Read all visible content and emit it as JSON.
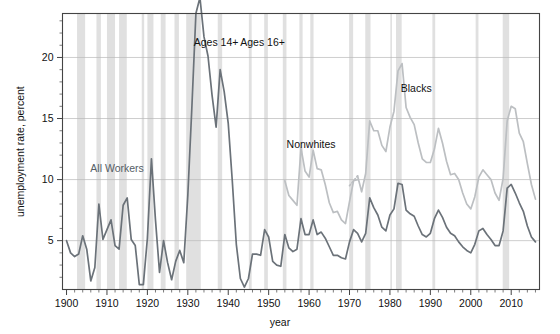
{
  "chart_data": {
    "type": "line",
    "title": "",
    "xlabel": "year",
    "ylabel": "unemployment rate, percent",
    "xlim": [
      1899,
      2017
    ],
    "ylim": [
      1.0,
      23.6
    ],
    "xticks": [
      1900,
      1910,
      1920,
      1930,
      1940,
      1950,
      1960,
      1970,
      1980,
      1990,
      2000,
      2010
    ],
    "xticklabels": [
      "1900",
      "1910",
      "1920",
      "1930",
      "1940",
      "1950",
      "1960",
      "1970",
      "1980",
      "1990",
      "2000",
      "2010"
    ],
    "yticks": [
      5,
      10,
      15,
      20
    ],
    "yticklabels": [
      "5",
      "10",
      "15",
      "20"
    ],
    "minor_x_interval": 2,
    "minor_y_interval": 1,
    "grid": "horizontal-only",
    "legend": "none",
    "annotations": [
      {
        "text": "All Workers",
        "x": 1912.5,
        "y": 10.6,
        "color": "#555e66"
      },
      {
        "text": "Ages 14+",
        "x": 1937.0,
        "y": 20.9,
        "color": "#111111"
      },
      {
        "text": "Ages 16+",
        "x": 1948.5,
        "y": 20.9,
        "color": "#111111"
      },
      {
        "text": "Nonwhites",
        "x": 1960.5,
        "y": 12.6,
        "color": "#111111"
      },
      {
        "text": "Blacks",
        "x": 1986.5,
        "y": 17.2,
        "color": "#111111"
      }
    ],
    "colors": {
      "all_workers": "#6b7279",
      "nonwhites": "#bcbfc2",
      "blacks": "#bcbfc2",
      "recession_band": "#e0e0e0",
      "axis": "#444444",
      "gridline": "#b9b9b9",
      "background": "#ffffff"
    },
    "recessions": [
      [
        1902.6,
        1904.6
      ],
      [
        1907.4,
        1908.5
      ],
      [
        1910.0,
        1912.0
      ],
      [
        1913.0,
        1914.9
      ],
      [
        1918.6,
        1919.2
      ],
      [
        1920.0,
        1921.5
      ],
      [
        1923.3,
        1924.5
      ],
      [
        1926.7,
        1927.8
      ],
      [
        1929.6,
        1933.2
      ],
      [
        1937.4,
        1938.5
      ],
      [
        1945.1,
        1945.8
      ],
      [
        1948.9,
        1949.8
      ],
      [
        1953.5,
        1954.4
      ],
      [
        1957.6,
        1958.4
      ],
      [
        1960.3,
        1961.1
      ],
      [
        1969.9,
        1970.9
      ],
      [
        1973.9,
        1975.2
      ],
      [
        1980.1,
        1980.5
      ],
      [
        1981.5,
        1982.9
      ],
      [
        1990.5,
        1991.2
      ],
      [
        2001.2,
        2001.9
      ],
      [
        2007.9,
        2009.5
      ]
    ],
    "series": [
      {
        "name": "All Workers",
        "color": "#6b7279",
        "width": 1.7,
        "x": [
          1900,
          1901,
          1902,
          1903,
          1904,
          1905,
          1906,
          1907,
          1908,
          1909,
          1910,
          1911,
          1912,
          1913,
          1914,
          1915,
          1916,
          1917,
          1918,
          1919,
          1920,
          1921,
          1922,
          1923,
          1924,
          1925,
          1926,
          1927,
          1928,
          1929,
          1930,
          1931,
          1932,
          1933,
          1934,
          1935,
          1936,
          1937,
          1938,
          1939,
          1940,
          1941,
          1942,
          1943,
          1944,
          1945,
          1946,
          1947,
          1948,
          1949,
          1950,
          1951,
          1952,
          1953,
          1954,
          1955,
          1956,
          1957,
          1958,
          1959,
          1960,
          1961,
          1962,
          1963,
          1964,
          1965,
          1966,
          1967,
          1968,
          1969,
          1970,
          1971,
          1972,
          1973,
          1974,
          1975,
          1976,
          1977,
          1978,
          1979,
          1980,
          1981,
          1982,
          1983,
          1984,
          1985,
          1986,
          1987,
          1988,
          1989,
          1990,
          1991,
          1992,
          1993,
          1994,
          1995,
          1996,
          1997,
          1998,
          1999,
          2000,
          2001,
          2002,
          2003,
          2004,
          2005,
          2006,
          2007,
          2008,
          2009,
          2010,
          2011,
          2012,
          2013,
          2014,
          2015,
          2016
        ],
        "values": [
          5.0,
          4.0,
          3.7,
          3.9,
          5.4,
          4.3,
          1.7,
          2.8,
          8.0,
          5.1,
          5.9,
          6.7,
          4.6,
          4.3,
          7.9,
          8.5,
          5.1,
          4.6,
          1.4,
          1.4,
          5.2,
          11.7,
          6.7,
          2.4,
          5.0,
          3.2,
          1.8,
          3.3,
          4.2,
          3.2,
          8.7,
          15.9,
          23.6,
          24.9,
          21.7,
          20.1,
          16.9,
          14.3,
          19.0,
          17.2,
          14.6,
          9.9,
          4.7,
          1.9,
          1.2,
          1.9,
          3.9,
          3.9,
          3.8,
          5.9,
          5.3,
          3.3,
          3.0,
          2.9,
          5.5,
          4.4,
          4.1,
          4.3,
          6.8,
          5.5,
          5.5,
          6.7,
          5.5,
          5.7,
          5.2,
          4.5,
          3.8,
          3.8,
          3.6,
          3.5,
          4.9,
          5.9,
          5.6,
          4.9,
          5.6,
          8.5,
          7.7,
          7.1,
          6.1,
          5.8,
          7.1,
          7.6,
          9.7,
          9.6,
          7.5,
          7.2,
          7.0,
          6.2,
          5.5,
          5.3,
          5.6,
          6.8,
          7.5,
          6.9,
          6.1,
          5.6,
          5.4,
          4.9,
          4.5,
          4.2,
          4.0,
          4.7,
          5.8,
          6.0,
          5.5,
          5.1,
          4.6,
          4.6,
          5.8,
          9.3,
          9.6,
          8.9,
          8.1,
          7.4,
          6.2,
          5.3,
          4.9
        ]
      },
      {
        "name": "Nonwhites",
        "color": "#bcbfc2",
        "width": 1.7,
        "x": [
          1954,
          1955,
          1956,
          1957,
          1958,
          1959,
          1960,
          1961,
          1962,
          1963,
          1964,
          1965,
          1966,
          1967,
          1968,
          1969,
          1970,
          1971,
          1972
        ],
        "values": [
          9.9,
          8.7,
          8.3,
          7.9,
          12.6,
          10.7,
          10.2,
          12.4,
          10.9,
          10.8,
          9.6,
          8.1,
          7.3,
          7.4,
          6.7,
          6.4,
          8.2,
          9.9,
          10.0
        ]
      },
      {
        "name": "Blacks",
        "color": "#bcbfc2",
        "width": 1.7,
        "x": [
          1972,
          1973,
          1974,
          1975,
          1976,
          1977,
          1978,
          1979,
          1980,
          1981,
          1982,
          1983,
          1984,
          1985,
          1986,
          1987,
          1988,
          1989,
          1990,
          1991,
          1992,
          1993,
          1994,
          1995,
          1996,
          1997,
          1998,
          1999,
          2000,
          2001,
          2002,
          2003,
          2004,
          2005,
          2006,
          2007,
          2008,
          2009,
          2010,
          2011,
          2012,
          2013,
          2014,
          2015,
          2016
        ],
        "values": [
          10.3,
          9.0,
          10.5,
          14.8,
          14.0,
          14.0,
          12.8,
          12.3,
          14.3,
          15.6,
          18.9,
          19.5,
          15.9,
          15.1,
          14.5,
          13.0,
          11.7,
          11.4,
          11.4,
          12.5,
          14.2,
          13.0,
          11.5,
          10.4,
          10.5,
          10.0,
          8.9,
          8.0,
          7.6,
          8.6,
          10.2,
          10.8,
          10.4,
          10.0,
          8.9,
          8.3,
          10.1,
          14.8,
          16.0,
          15.8,
          13.8,
          13.1,
          11.3,
          9.6,
          8.4
        ]
      },
      {
        "name": "Nonwhites-Blacks transition",
        "color": "#bcbfc2",
        "width": 1.7,
        "dashed": true,
        "x": [
          1970,
          1971,
          1972
        ],
        "values": [
          9.5,
          9.9,
          10.3
        ]
      }
    ]
  }
}
